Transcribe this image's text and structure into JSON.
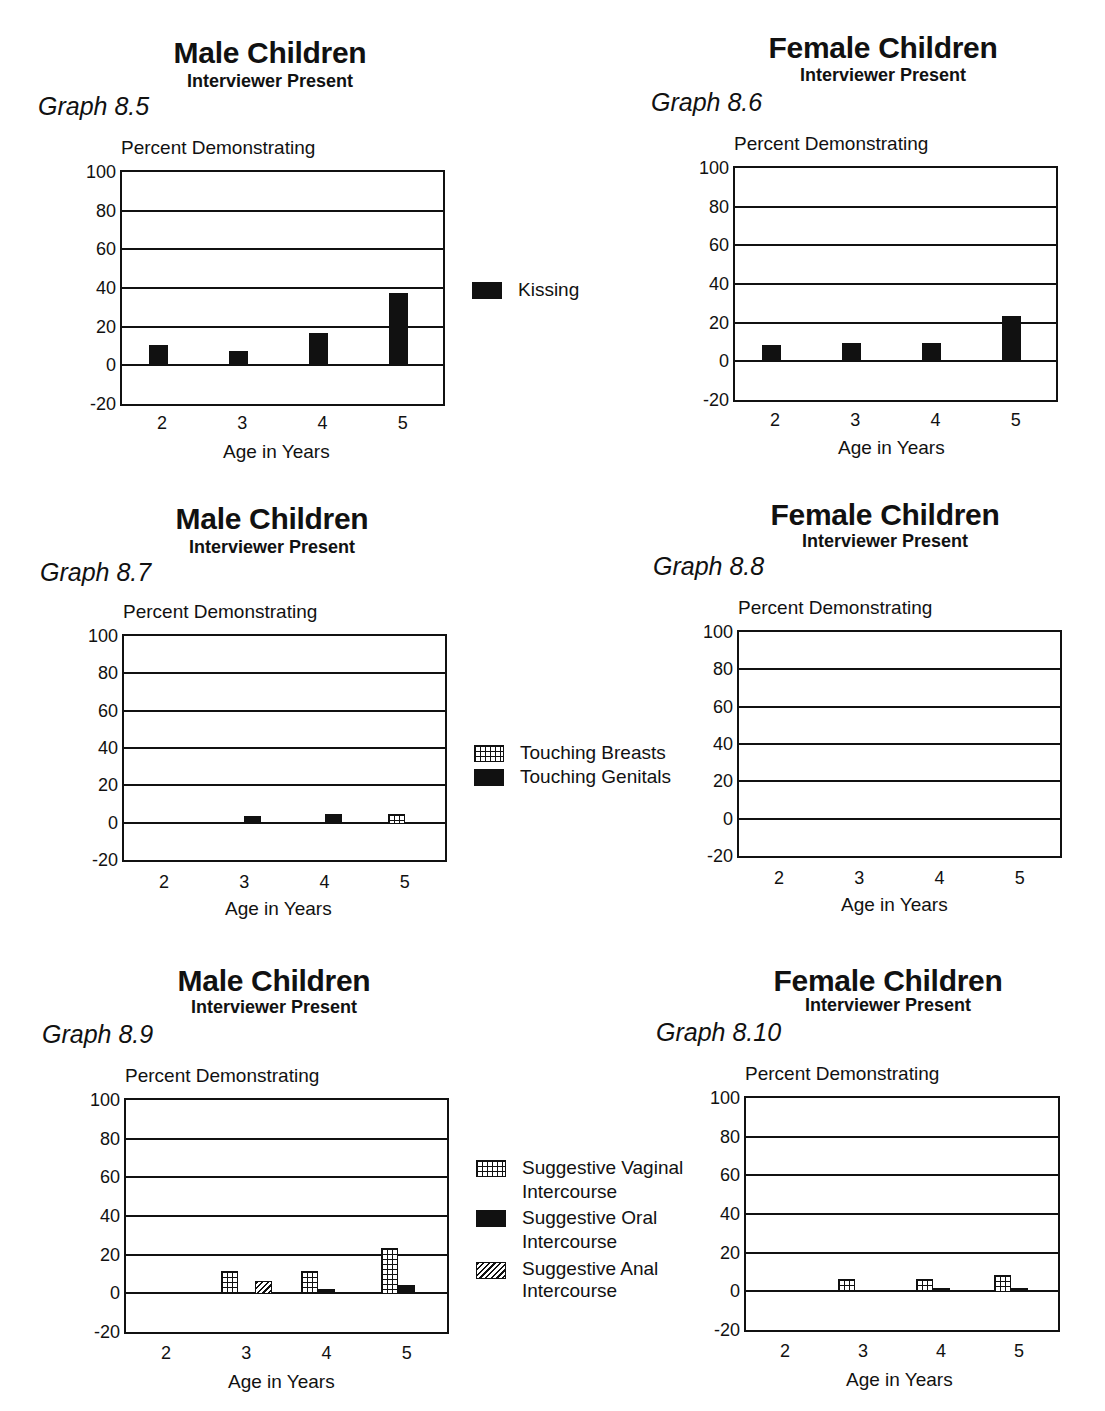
{
  "page_header": "(continued)",
  "chart_data": [
    {
      "id": "graph-8-5",
      "type": "bar",
      "graph_label": "Graph 8.5",
      "title": "Male Children",
      "subtitle": "Interviewer Present",
      "ylabel": "Percent Demonstrating",
      "xlabel": "Age in Years",
      "categories": [
        "2",
        "3",
        "4",
        "5"
      ],
      "ylim": [
        -20,
        100
      ],
      "yticks": [
        "100",
        "80",
        "60",
        "40",
        "20",
        "0",
        "-20"
      ],
      "grid": true,
      "series": [
        {
          "name": "Kissing",
          "pattern": "solid",
          "values": [
            11,
            8,
            17,
            38
          ]
        }
      ],
      "legend": {
        "position": "right",
        "entries": [
          "Kissing"
        ]
      }
    },
    {
      "id": "graph-8-6",
      "type": "bar",
      "graph_label": "Graph 8.6",
      "title": "Female Children",
      "subtitle": "Interviewer Present",
      "ylabel": "Percent Demonstrating",
      "xlabel": "Age in Years",
      "categories": [
        "2",
        "3",
        "4",
        "5"
      ],
      "ylim": [
        -20,
        100
      ],
      "yticks": [
        "100",
        "80",
        "60",
        "40",
        "20",
        "0",
        "-20"
      ],
      "grid": true,
      "series": [
        {
          "name": "Kissing",
          "pattern": "solid",
          "values": [
            9,
            10,
            10,
            24
          ]
        }
      ]
    },
    {
      "id": "graph-8-7",
      "type": "bar",
      "graph_label": "Graph 8.7",
      "title": "Male Children",
      "subtitle": "Interviewer Present",
      "ylabel": "Percent Demonstrating",
      "xlabel": "Age in Years",
      "categories": [
        "2",
        "3",
        "4",
        "5"
      ],
      "ylim": [
        -20,
        100
      ],
      "yticks": [
        "100",
        "80",
        "60",
        "40",
        "20",
        "0",
        "-20"
      ],
      "grid": true,
      "series": [
        {
          "name": "Touching Breasts",
          "pattern": "grid",
          "values": [
            0.5,
            0.5,
            1,
            5
          ]
        },
        {
          "name": "Touching Genitals",
          "pattern": "solid",
          "values": [
            0.5,
            4,
            5,
            1
          ]
        }
      ],
      "legend": {
        "position": "right",
        "entries": [
          "Touching Breasts",
          "Touching Genitals"
        ]
      }
    },
    {
      "id": "graph-8-8",
      "type": "bar",
      "graph_label": "Graph 8.8",
      "title": "Female Children",
      "subtitle": "Interviewer Present",
      "ylabel": "Percent Demonstrating",
      "xlabel": "Age in Years",
      "categories": [
        "2",
        "3",
        "4",
        "5"
      ],
      "ylim": [
        -20,
        100
      ],
      "yticks": [
        "100",
        "80",
        "60",
        "40",
        "20",
        "0",
        "-20"
      ],
      "grid": true,
      "series": [
        {
          "name": "Touching Breasts",
          "pattern": "grid",
          "values": [
            0.5,
            0.5,
            0.5,
            0.5
          ]
        },
        {
          "name": "Touching Genitals",
          "pattern": "solid",
          "values": [
            0.5,
            0.5,
            0.5,
            0.5
          ]
        }
      ]
    },
    {
      "id": "graph-8-9",
      "type": "bar",
      "graph_label": "Graph 8.9",
      "title": "Male Children",
      "subtitle": "Interviewer Present",
      "ylabel": "Percent Demonstrating",
      "xlabel": "Age in Years",
      "categories": [
        "2",
        "3",
        "4",
        "5"
      ],
      "ylim": [
        -20,
        100
      ],
      "yticks": [
        "100",
        "80",
        "60",
        "40",
        "20",
        "0",
        "-20"
      ],
      "grid": true,
      "series": [
        {
          "name": "Suggestive Vaginal Intercourse",
          "pattern": "grid",
          "values": [
            0.5,
            12,
            12,
            24
          ]
        },
        {
          "name": "Suggestive Oral Intercourse",
          "pattern": "solid",
          "values": [
            1,
            1,
            3,
            5
          ]
        },
        {
          "name": "Suggestive Anal Intercourse",
          "pattern": "hatch",
          "values": [
            0.5,
            7,
            1,
            1
          ]
        }
      ],
      "legend": {
        "position": "right",
        "entries": [
          [
            "Suggestive Vaginal",
            "Intercourse"
          ],
          [
            "Suggestive Oral",
            "Intercourse"
          ],
          [
            "Suggestive Anal",
            "Intercourse"
          ]
        ]
      }
    },
    {
      "id": "graph-8-10",
      "type": "bar",
      "graph_label": "Graph 8.10",
      "title": "Female Children",
      "subtitle": "Interviewer Present",
      "ylabel": "Percent Demonstrating",
      "xlabel": "Age in Years",
      "categories": [
        "2",
        "3",
        "4",
        "5"
      ],
      "ylim": [
        -20,
        100
      ],
      "yticks": [
        "100",
        "80",
        "60",
        "40",
        "20",
        "0",
        "-20"
      ],
      "grid": true,
      "series": [
        {
          "name": "Suggestive Vaginal Intercourse",
          "pattern": "grid",
          "values": [
            0.5,
            7,
            7,
            9
          ]
        },
        {
          "name": "Suggestive Oral Intercourse",
          "pattern": "solid",
          "values": [
            1,
            1,
            2,
            2
          ]
        },
        {
          "name": "Suggestive Anal Intercourse",
          "pattern": "hatch",
          "values": [
            0.5,
            0.5,
            0.5,
            0.5
          ]
        }
      ]
    }
  ],
  "legends": {
    "kissing": {
      "label": "Kissing"
    },
    "touching": {
      "breasts": "Touching Breasts",
      "genitals": "Touching Genitals"
    },
    "intercourse": {
      "vaginal_1": "Suggestive Vaginal",
      "vaginal_2": "Intercourse",
      "oral_1": "Suggestive Oral",
      "oral_2": "Intercourse",
      "anal_1": "Suggestive Anal",
      "anal_2": "Intercourse"
    }
  }
}
